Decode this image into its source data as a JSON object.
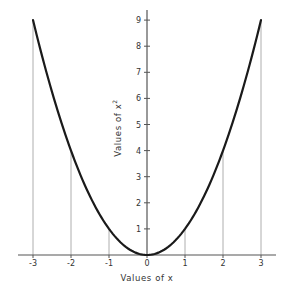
{
  "chart_data": {
    "type": "line",
    "title": "",
    "xlabel": "Values of x",
    "ylabel": "Values of x²",
    "ylabel_base": "Values of x",
    "ylabel_sup": "2",
    "function": "y = x^2",
    "x": [
      -3,
      -2,
      -1,
      0,
      1,
      2,
      3
    ],
    "series": [
      {
        "name": "x squared",
        "values": [
          9,
          4,
          1,
          0,
          1,
          4,
          9
        ]
      }
    ],
    "xlim": [
      -3.3,
      3.3
    ],
    "ylim": [
      0,
      9.4
    ],
    "xticks": [
      -3,
      -2,
      -1,
      0,
      1,
      2,
      3
    ],
    "xtick_labels": [
      "-3",
      "-2",
      "-1",
      "0",
      "1",
      "2",
      "3"
    ],
    "yticks": [
      1,
      2,
      3,
      4,
      5,
      6,
      7,
      8,
      9
    ],
    "ytick_labels": [
      "1",
      "2",
      "3",
      "4",
      "5",
      "6",
      "7",
      "8",
      "9"
    ],
    "grid": false,
    "drop_lines": "thin vertical lines from each integer x up to the curve",
    "legend": null,
    "colors": {
      "curve": "#1a1a1a",
      "axes": "#555555",
      "droplines": "#9a9a9a"
    }
  }
}
